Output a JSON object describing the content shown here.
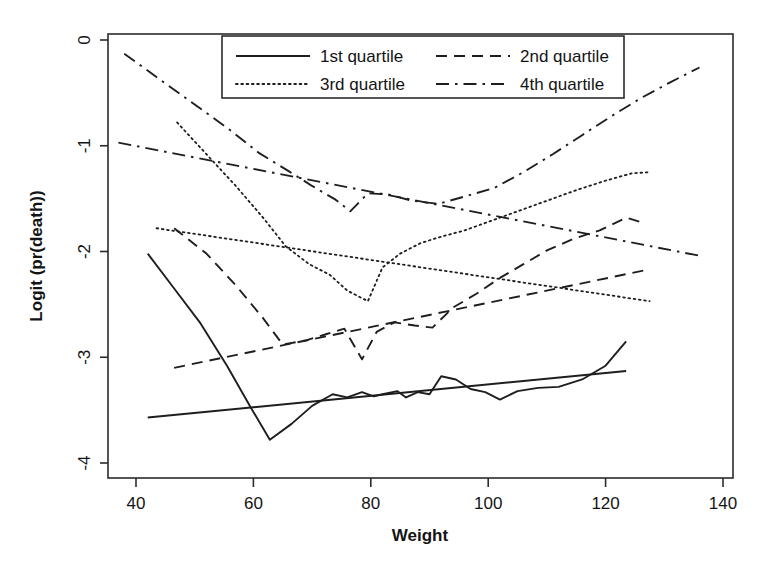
{
  "figure": {
    "title": "",
    "background_color": "#ffffff",
    "ink_color": "#1e1e1e"
  },
  "axes": {
    "x_label": "Weight",
    "y_label": "Logit (pr(death))",
    "x_ticks": [
      "40",
      "60",
      "80",
      "100",
      "120",
      "140"
    ],
    "y_ticks": [
      "0",
      "-1",
      "-2",
      "-3",
      "-4"
    ]
  },
  "legend": {
    "entries": [
      {
        "label": "1st quartile",
        "style": "solid"
      },
      {
        "label": "2nd quartile",
        "style": "dashed"
      },
      {
        "label": "3rd quartile",
        "style": "dotted"
      },
      {
        "label": "4th quartile",
        "style": "dash-dot"
      }
    ]
  },
  "chart_data": {
    "type": "line",
    "title": "",
    "xlabel": "Weight",
    "ylabel": "Logit (pr(death))",
    "xlim": [
      35.2,
      141.7
    ],
    "ylim": [
      -4.15,
      0.14
    ],
    "xticks": [
      40,
      60,
      80,
      100,
      120,
      140
    ],
    "yticks": [
      0,
      -1,
      -2,
      -3,
      -4
    ],
    "grid": false,
    "legend_position": "top-center",
    "series": [
      {
        "name": "1st quartile",
        "style": "solid",
        "role": "empirical",
        "x": [
          42.0,
          46.5,
          51.0,
          55.5,
          59.5,
          62.8,
          66.5,
          70.0,
          73.5,
          76.0,
          78.5,
          80.5,
          82.0,
          84.5,
          86.0,
          88.0,
          90.0,
          92.0,
          94.5,
          97.0,
          99.5,
          102.0,
          105.0,
          108.5,
          112.0,
          116.0,
          120.0,
          123.5
        ],
        "y": [
          -2.02,
          -2.35,
          -2.68,
          -3.08,
          -3.47,
          -3.78,
          -3.63,
          -3.46,
          -3.35,
          -3.38,
          -3.33,
          -3.37,
          -3.35,
          -3.32,
          -3.38,
          -3.33,
          -3.35,
          -3.18,
          -3.21,
          -3.3,
          -3.33,
          -3.4,
          -3.32,
          -3.29,
          -3.28,
          -3.21,
          -3.08,
          -2.85
        ]
      },
      {
        "name": "1st quartile",
        "style": "solid",
        "role": "fitted",
        "x": [
          42.0,
          123.5
        ],
        "y": [
          -3.57,
          -3.13
        ]
      },
      {
        "name": "2nd quartile",
        "style": "dashed",
        "role": "empirical",
        "x": [
          46.5,
          52.0,
          57.0,
          61.5,
          65.0,
          69.0,
          72.5,
          75.5,
          78.5,
          81.0,
          84.0,
          87.5,
          90.5,
          94.0,
          98.0,
          102.0,
          106.0,
          110.0,
          114.5,
          119.0,
          123.5,
          126.5
        ],
        "y": [
          -1.78,
          -2.02,
          -2.32,
          -2.62,
          -2.88,
          -2.84,
          -2.78,
          -2.73,
          -3.02,
          -2.76,
          -2.67,
          -2.7,
          -2.72,
          -2.53,
          -2.4,
          -2.25,
          -2.12,
          -1.99,
          -1.88,
          -1.8,
          -1.68,
          -1.73
        ]
      },
      {
        "name": "2nd quartile",
        "style": "dashed",
        "role": "fitted",
        "x": [
          46.5,
          126.5
        ],
        "y": [
          -3.1,
          -2.18
        ]
      },
      {
        "name": "3rd quartile",
        "style": "dotted",
        "role": "empirical",
        "x": [
          47.0,
          52.0,
          57.0,
          61.5,
          65.5,
          69.5,
          73.0,
          76.0,
          79.5,
          82.0,
          85.0,
          88.5,
          92.0,
          96.0,
          100.0,
          105.0,
          110.0,
          115.0,
          120.0,
          124.5,
          127.5
        ],
        "y": [
          -0.78,
          -1.08,
          -1.38,
          -1.67,
          -1.95,
          -2.12,
          -2.22,
          -2.37,
          -2.47,
          -2.15,
          -2.02,
          -1.92,
          -1.86,
          -1.8,
          -1.72,
          -1.62,
          -1.52,
          -1.42,
          -1.33,
          -1.26,
          -1.25
        ]
      },
      {
        "name": "3rd quartile",
        "style": "dotted",
        "role": "fitted",
        "x": [
          43.5,
          127.5
        ],
        "y": [
          -1.78,
          -2.47
        ]
      },
      {
        "name": "4th quartile",
        "style": "dash-dot",
        "role": "empirical",
        "x": [
          38.0,
          44.0,
          50.0,
          56.0,
          61.0,
          66.0,
          70.0,
          74.0,
          76.5,
          79.5,
          83.0,
          87.0,
          91.5,
          96.0,
          101.0,
          106.0,
          111.0,
          116.0,
          121.0,
          126.0,
          131.0,
          136.0
        ],
        "y": [
          -0.13,
          -0.37,
          -0.61,
          -0.85,
          -1.07,
          -1.24,
          -1.38,
          -1.51,
          -1.62,
          -1.45,
          -1.46,
          -1.52,
          -1.55,
          -1.48,
          -1.4,
          -1.25,
          -1.08,
          -0.9,
          -0.72,
          -0.55,
          -0.4,
          -0.26
        ]
      },
      {
        "name": "4th quartile",
        "style": "dash-dot",
        "role": "fitted",
        "x": [
          37.0,
          136.0
        ],
        "y": [
          -0.97,
          -2.04
        ]
      }
    ]
  }
}
